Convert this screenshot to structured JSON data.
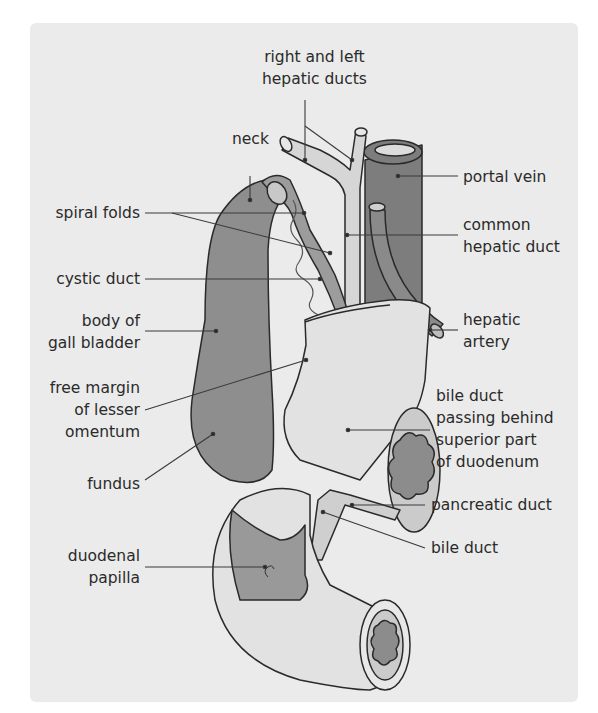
{
  "diagram": {
    "colors": {
      "background": "#ffffff",
      "panel": "#ebebeb",
      "gallbladder": "#8e8e8e",
      "portal_vein": "#7d7d7d",
      "duct_light": "#d6d6d6",
      "duodenum_wall": "#e2e2e2",
      "duodenum_interior": "#999999",
      "outline": "#2a2a2a",
      "leader_line": "#3a3a3a"
    },
    "labels": {
      "right_left_hepatic": [
        "right and left",
        "hepatic ducts"
      ],
      "neck": [
        "neck"
      ],
      "spiral_folds": [
        "spiral folds"
      ],
      "cystic_duct": [
        "cystic duct"
      ],
      "body_gall_bladder": [
        "body of",
        "gall bladder"
      ],
      "free_margin": [
        "free margin",
        "of lesser",
        "omentum"
      ],
      "fundus": [
        "fundus"
      ],
      "duodenal_papilla": [
        "duodenal",
        "papilla"
      ],
      "portal_vein": [
        "portal vein"
      ],
      "common_hepatic_duct": [
        "common",
        "hepatic duct"
      ],
      "hepatic_artery": [
        "hepatic",
        "artery"
      ],
      "bile_duct_behind": [
        "bile duct",
        "passing behind",
        "superior part",
        "of duodenum"
      ],
      "pancreatic_duct": [
        "pancreatic duct"
      ],
      "bile_duct": [
        "bile duct"
      ]
    }
  }
}
